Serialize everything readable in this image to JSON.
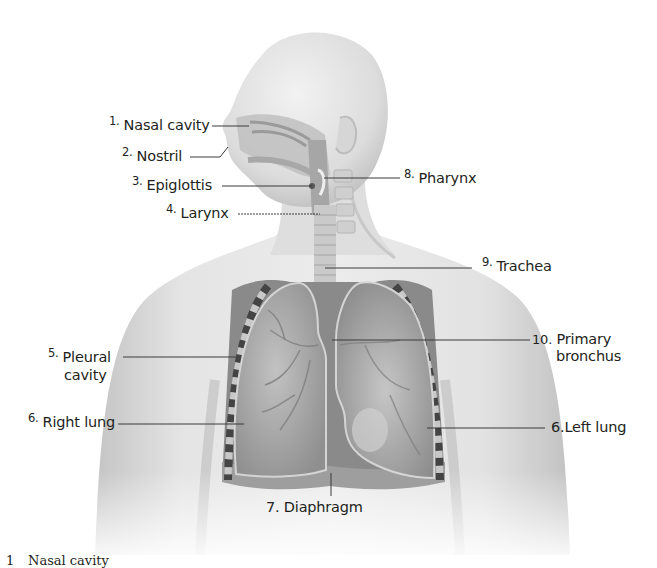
{
  "diagram": {
    "labels": [
      {
        "id": "nasal-cavity",
        "number": "1.",
        "text": "Nasal cavity"
      },
      {
        "id": "nostril",
        "number": "2.",
        "text": "Nostril"
      },
      {
        "id": "epiglottis",
        "number": "3.",
        "text": "Epiglottis"
      },
      {
        "id": "larynx",
        "number": "4.",
        "text": "Larynx"
      },
      {
        "id": "pleural-cavity",
        "number": "5.",
        "text": "Pleural",
        "text2": "cavity"
      },
      {
        "id": "right-lung",
        "number": "6.",
        "text": "Right lung"
      },
      {
        "id": "diaphragm",
        "number": "7.",
        "text": "Diaphragm"
      },
      {
        "id": "pharynx",
        "number": "8.",
        "text": "Pharynx"
      },
      {
        "id": "trachea",
        "number": "9.",
        "text": "Trachea"
      },
      {
        "id": "primary-bronchus",
        "number": "10.",
        "text": "Primary",
        "text2": "bronchus"
      },
      {
        "id": "left-lung",
        "number": "6.",
        "text": "Left lung"
      }
    ],
    "colors": {
      "skin": "#e6e6e6",
      "skin_shadow": "#c9c9c9",
      "lung": "#a9a9a9",
      "lung_dark": "#8c8c8c",
      "cavity": "#7a7a7a",
      "rib": "#4a4a4a",
      "leader_line": "#3a3a3a",
      "text": "#231f20"
    }
  },
  "footer": {
    "items": [
      {
        "number": "1",
        "text": "Nasal cavity"
      }
    ]
  }
}
